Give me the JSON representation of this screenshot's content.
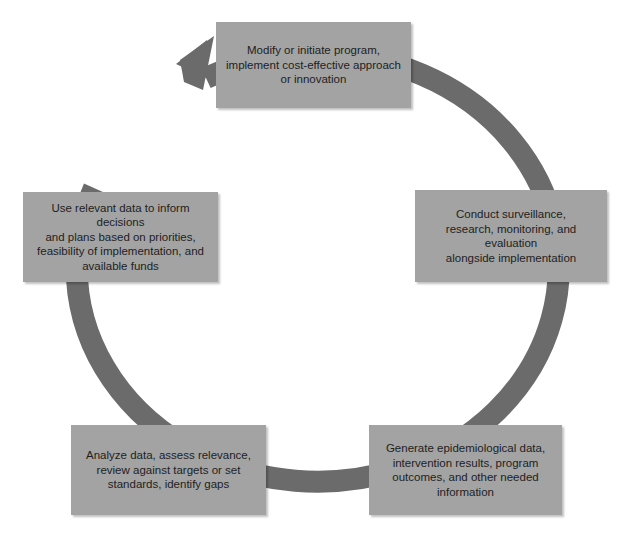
{
  "diagram": {
    "type": "cycle",
    "colors": {
      "background": "#ffffff",
      "box_fill": "#a3a3a3",
      "ring": "#6b6b6b",
      "text": "#1e1e1e"
    },
    "steps": [
      {
        "id": "modify",
        "lines": [
          "Modify or initiate program,",
          "implement cost-effective approach",
          "or innovation"
        ]
      },
      {
        "id": "conduct",
        "lines": [
          "Conduct surveillance,",
          "research, monitoring, and evaluation",
          "alongside implementation"
        ]
      },
      {
        "id": "generate",
        "lines": [
          "Generate epidemiological data,",
          "intervention results, program",
          "outcomes, and other needed",
          "information"
        ]
      },
      {
        "id": "analyze",
        "lines": [
          "Analyze data, assess relevance,",
          "review against targets or set",
          "standards, identify gaps"
        ]
      },
      {
        "id": "use",
        "lines": [
          "Use relevant data to inform decisions",
          "and plans based on priorities,",
          "feasibility of implementation, and",
          "available funds"
        ]
      }
    ],
    "flow_direction": "clockwise",
    "arrowhead_icon": "arrow-northeast"
  }
}
